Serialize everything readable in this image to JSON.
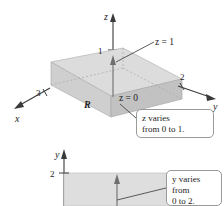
{
  "figure": {
    "kind": "math-textbook-solid-region-diagram",
    "background_color": "#ffffff",
    "solid_fill_color": "#cfcfcf",
    "axis_color": "#3a3a3a",
    "callout_border_color": "#9a9a9a"
  },
  "top_figure": {
    "name": "solid-region-3d",
    "axes": [
      {
        "id": "z",
        "label": "z",
        "direction": "up"
      },
      {
        "id": "y",
        "label": "y",
        "direction": "right"
      },
      {
        "id": "x",
        "label": "x",
        "direction": "down-left"
      }
    ],
    "tick_labels": {
      "z_axis": "1",
      "y_axis": "2",
      "x_axis": "3"
    },
    "region_label": "R",
    "surface_labels": {
      "top": "z = 1",
      "bottom": "z = 0"
    }
  },
  "bottom_figure": {
    "name": "projection-region-2d",
    "axes": [
      {
        "id": "y",
        "label": "y",
        "direction": "up"
      }
    ],
    "tick_labels": {
      "y_axis": "2"
    }
  },
  "callouts": [
    {
      "id": "z-varies",
      "text": "z varies\nfrom 0 to 1.",
      "lines": [
        "z varies",
        "from 0 to 1."
      ]
    },
    {
      "id": "y-varies",
      "text": "y varies\nfrom\n0 to 2.",
      "lines": [
        "y varies",
        "from",
        "0 to 2."
      ]
    }
  ]
}
